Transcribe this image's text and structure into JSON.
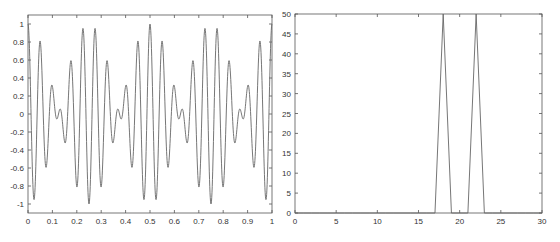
{
  "chart_data": [
    {
      "type": "line",
      "title": "",
      "xlabel": "",
      "ylabel": "",
      "xlim": [
        0,
        1
      ],
      "ylim": [
        -1.1,
        1.1
      ],
      "grid": false,
      "legend": null,
      "xticks": [
        "0",
        "0.1",
        "0.2",
        "0.3",
        "0.4",
        "0.5",
        "0.6",
        "0.7",
        "0.8",
        "0.9",
        "1"
      ],
      "yticks": [
        "-1",
        "-0.8",
        "-0.6",
        "-0.4",
        "-0.2",
        "0",
        "0.2",
        "0.4",
        "0.6",
        "0.8",
        "1"
      ],
      "series": [
        {
          "name": "signal",
          "formula": "cos(2*pi*20*t) * cos(2*pi*2*t)",
          "t_start": 0,
          "t_end": 1,
          "samples": 100,
          "color": "#666666"
        }
      ],
      "axes_px": {
        "left": 28,
        "top": 15,
        "right": 272,
        "bottom": 213
      }
    },
    {
      "type": "line",
      "title": "",
      "xlabel": "",
      "ylabel": "",
      "xlim": [
        0,
        30
      ],
      "ylim": [
        0,
        50
      ],
      "grid": false,
      "legend": null,
      "xticks": [
        "0",
        "5",
        "10",
        "15",
        "20",
        "25",
        "30"
      ],
      "yticks": [
        "0",
        "5",
        "10",
        "15",
        "20",
        "25",
        "30",
        "35",
        "40",
        "45",
        "50"
      ],
      "series": [
        {
          "name": "spectrum magnitude",
          "x": [
            0,
            1,
            2,
            3,
            4,
            5,
            6,
            7,
            8,
            9,
            10,
            11,
            12,
            13,
            14,
            15,
            16,
            17,
            18,
            19,
            20,
            21,
            22,
            23,
            24,
            25,
            26,
            27,
            28,
            29,
            30
          ],
          "values": [
            0,
            0,
            0,
            0,
            0,
            0,
            0,
            0,
            0,
            0,
            0,
            0,
            0,
            0,
            0,
            0,
            0,
            0,
            50,
            0,
            0,
            0,
            50,
            0,
            0,
            0,
            0,
            0,
            0,
            0,
            0
          ],
          "color": "#666666"
        }
      ],
      "axes_px": {
        "left": 295,
        "top": 14,
        "right": 542,
        "bottom": 213
      }
    }
  ]
}
